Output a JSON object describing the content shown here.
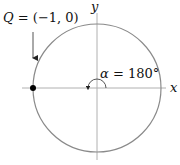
{
  "diagram": {
    "type": "unit-circle",
    "point_label": "Q = (−1, 0)",
    "point_label_parts": {
      "name": "Q",
      "eq": " = ",
      "coords": "(−1, 0)"
    },
    "angle_label": "α = 180°",
    "angle_label_parts": {
      "sym": "α",
      "eq": " = ",
      "value": "180°"
    },
    "x_axis_label": "x",
    "y_axis_label": "y",
    "colors": {
      "circle": "#8a8a8a",
      "axes": "#b0b0b0",
      "point": "#000000",
      "arrow": "#555555",
      "text": "#111111"
    }
  }
}
